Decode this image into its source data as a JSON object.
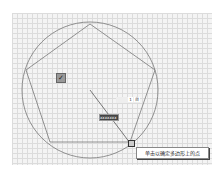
{
  "drawing": {
    "circle": {
      "cx": 90,
      "cy": 90,
      "r": 68
    },
    "polygon_points": "90,24 155,70 130,142 50,142 26,70",
    "radius_line": {
      "x1": 90,
      "y1": 90,
      "x2": 130,
      "y2": 143
    },
    "colors": {
      "geometry": "#777777",
      "background": "#f4f4f4"
    }
  },
  "dimension_input": {
    "value": "1",
    "suffix": "台"
  },
  "dynamic_input": {
    "value": "xxxxxxx"
  },
  "snap_icon": "checkmark-icon",
  "tooltip": {
    "text": "单击以确定多边形上的点"
  }
}
